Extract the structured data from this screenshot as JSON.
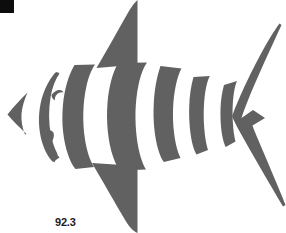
{
  "figure": {
    "style": "stencil silhouette",
    "background_color": "#ffffff",
    "shape_color": "#616161",
    "marker_color": "#0d0d0d",
    "label_color": "#1b1b1b",
    "canvas": {
      "width": 286,
      "height": 233
    }
  },
  "corner_marker": {
    "name": "black-square-marker",
    "x": 0,
    "y": 0,
    "width": 14,
    "height": 13
  },
  "label": {
    "text": "92.3",
    "x": 55,
    "y": 216
  },
  "parts": {
    "snout": "snout-wedge",
    "head": "head-crescent",
    "eye": "eye-notch",
    "gill": "gill-slit",
    "dorsal_fin": "dorsal-fin",
    "ventral_fin": "ventral-fin",
    "tail": "tail-fin",
    "stripes": [
      "body-stripe-1",
      "body-stripe-2",
      "body-stripe-3",
      "body-stripe-4",
      "body-stripe-5"
    ]
  }
}
